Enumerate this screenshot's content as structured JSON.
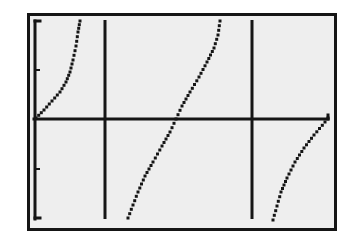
{
  "chart_data": {
    "type": "line",
    "title": "",
    "xlabel": "",
    "ylabel": "",
    "function": "y = tan(x)",
    "series": [
      {
        "name": "tan branch 1 (left, partial)",
        "points": [
          [
            36,
            118
          ],
          [
            44,
            110
          ],
          [
            52,
            101
          ],
          [
            60,
            92
          ],
          [
            66,
            82
          ],
          [
            70,
            72
          ],
          [
            73,
            60
          ],
          [
            76,
            46
          ],
          [
            78,
            32
          ],
          [
            80,
            21
          ]
        ]
      },
      {
        "name": "tan branch 2 (middle)",
        "points": [
          [
            128,
            218
          ],
          [
            133,
            205
          ],
          [
            138,
            192
          ],
          [
            145,
            176
          ],
          [
            153,
            162
          ],
          [
            162,
            146
          ],
          [
            170,
            132
          ],
          [
            176,
            119
          ],
          [
            182,
            106
          ],
          [
            190,
            92
          ],
          [
            199,
            77
          ],
          [
            207,
            62
          ],
          [
            214,
            48
          ],
          [
            218,
            35
          ],
          [
            220,
            21
          ]
        ]
      },
      {
        "name": "tan branch 3 (right, partial)",
        "points": [
          [
            273,
            220
          ],
          [
            277,
            206
          ],
          [
            281,
            192
          ],
          [
            287,
            178
          ],
          [
            295,
            162
          ],
          [
            304,
            148
          ],
          [
            314,
            135
          ],
          [
            325,
            122
          ],
          [
            328,
            118
          ]
        ]
      }
    ],
    "asymptotes_x_px": [
      105,
      252
    ],
    "x_axis_y_px": 119,
    "y_axis_x_px": 35,
    "y_ticks_px": [
      21,
      70,
      169,
      218
    ],
    "grid": false,
    "legend": "none",
    "colors": {
      "screen": "#eeeeee",
      "ink": "#151515"
    }
  }
}
